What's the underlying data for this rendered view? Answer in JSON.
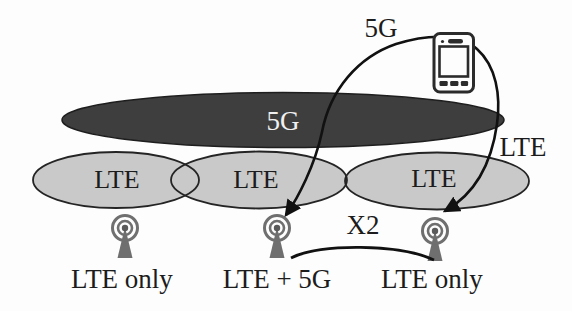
{
  "colors": {
    "background": "#fdfdfd",
    "nr_cell_fill": "#3e3e3e",
    "nr_cell_text": "#f0f0f0",
    "lte_cell_fill": "#c9c9c9",
    "cell_outline": "#242424",
    "antenna_gray": "#6f6f6f",
    "link_black": "#111111",
    "label_text": "#1c1c1c"
  },
  "coverage": {
    "nr_cell_label": "5G",
    "lte_cell_labels": [
      "LTE",
      "LTE",
      "LTE"
    ]
  },
  "links": {
    "ue_5g_link_label": "5G",
    "ue_lte_link_label": "LTE",
    "x2_interface_label": "X2"
  },
  "base_stations": [
    {
      "mode": "LTE only"
    },
    {
      "mode": "LTE + 5G"
    },
    {
      "mode": "LTE only"
    }
  ]
}
